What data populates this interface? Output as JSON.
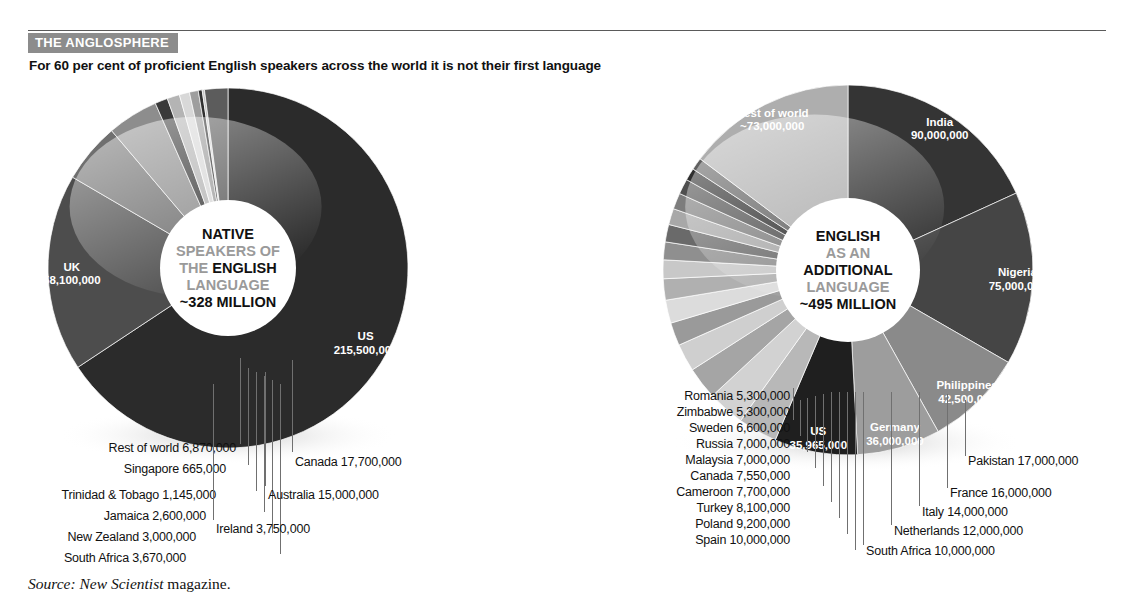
{
  "header": {
    "kicker": "THE ANGLOSPHERE",
    "subhead": "For 60 per cent of proficient English speakers across the world it is not their first language"
  },
  "footer": {
    "source_prefix": "Source:",
    "source_name": "New Scientist",
    "source_suffix": "magazine."
  },
  "chart_data": [
    {
      "type": "pie",
      "id": "native-speakers",
      "title": "NATIVE SPEAKERS OF THE ENGLISH LANGUAGE ~328 MILLION",
      "center_lines": [
        {
          "text": "NATIVE",
          "style": "bold"
        },
        {
          "text": "SPEAKERS OF",
          "style": "grey"
        },
        {
          "text": "THE ENGLISH",
          "style": "mixed"
        },
        {
          "text": "LANGUAGE",
          "style": "grey"
        },
        {
          "text": "~328 MILLION",
          "style": "bold"
        }
      ],
      "total_label": "~328 MILLION",
      "total": 328000000,
      "categories": [
        "US",
        "UK",
        "Canada",
        "Australia",
        "Ireland",
        "South Africa",
        "New Zealand",
        "Jamaica",
        "Trinidad & Tobago",
        "Singapore",
        "Rest of world"
      ],
      "values": [
        215500000,
        58100000,
        17700000,
        15000000,
        3750000,
        3670000,
        3000000,
        2600000,
        1145000,
        665000,
        6870000
      ],
      "value_labels": [
        "215,500,000",
        "58,100,000",
        "17,700,000",
        "15,000,000",
        "3,750,000",
        "3,670,000",
        "3,000,000",
        "2,600,000",
        "1,145,000",
        "665,000",
        "6,870,000"
      ],
      "colors": [
        "#2b2b2b",
        "#4d4d4d",
        "#6f6f6f",
        "#8d8d8d",
        "#3a3a3a",
        "#b4b4b4",
        "#d8d8d8",
        "#9e9e9e",
        "#303030",
        "#c6c6c6",
        "#5c5c5c"
      ],
      "inside_labels": [
        {
          "name": "US",
          "value": "215,500,000"
        },
        {
          "name": "UK",
          "value": "58,100,000"
        }
      ],
      "callouts_left": [
        {
          "name": "Rest of world",
          "value": "6,870,000"
        },
        {
          "name": "Singapore",
          "value": "665,000"
        },
        {
          "name": "Trinidad & Tobago",
          "value": "1,145,000"
        },
        {
          "name": "Jamaica",
          "value": "2,600,000"
        },
        {
          "name": "New Zealand",
          "value": "3,000,000"
        },
        {
          "name": "South Africa",
          "value": "3,670,000"
        }
      ],
      "callouts_right": [
        {
          "name": "Canada",
          "value": "17,700,000"
        },
        {
          "name": "Australia",
          "value": "15,000,000"
        },
        {
          "name": "Ireland",
          "value": "3,750,000"
        }
      ]
    },
    {
      "type": "pie",
      "id": "additional-language",
      "title": "ENGLISH AS AN ADDITIONAL LANGUAGE ~495 MILLION",
      "center_lines": [
        {
          "text": "ENGLISH",
          "style": "bold"
        },
        {
          "text": "AS AN",
          "style": "grey"
        },
        {
          "text": "ADDITIONAL",
          "style": "bold"
        },
        {
          "text": "LANGUAGE",
          "style": "grey"
        },
        {
          "text": "~495 MILLION",
          "style": "bold"
        }
      ],
      "total_label": "~495 MILLION",
      "total": 495000000,
      "categories": [
        "India",
        "Nigeria",
        "Philippines",
        "Germany",
        "US",
        "Pakistan",
        "France",
        "Italy",
        "Netherlands",
        "South Africa",
        "Spain",
        "Poland",
        "Turkey",
        "Cameroon",
        "Canada",
        "Malaysia",
        "Russia",
        "Sweden",
        "Zimbabwe",
        "Romania",
        "Rest of world"
      ],
      "values": [
        90000000,
        75000000,
        42500000,
        36000000,
        35965000,
        17000000,
        16000000,
        14000000,
        12000000,
        10000000,
        10000000,
        9200000,
        8100000,
        7700000,
        7550000,
        7000000,
        7000000,
        6600000,
        5300000,
        5300000,
        73000000
      ],
      "value_labels": [
        "90,000,000",
        "75,000,000",
        "42,500,000",
        "36,000,000",
        "35,965,000",
        "17,000,000",
        "16,000,000",
        "14,000,000",
        "12,000,000",
        "10,000,000",
        "10,000,000",
        "9,200,000",
        "8,100,000",
        "7,700,000",
        "7,550,000",
        "7,000,000",
        "7,000,000",
        "6,600,000",
        "5,300,000",
        "5,300,000",
        "~73,000,000"
      ],
      "colors": [
        "#343434",
        "#454545",
        "#8a8a8a",
        "#9d9d9d",
        "#1f1f1f",
        "#b8b8b8",
        "#d2d2d2",
        "#a5a5a5",
        "#cfcfcf",
        "#9a9a9a",
        "#dcdcdc",
        "#b0b0b0",
        "#c8c8c8",
        "#8f8f8f",
        "#6a6a6a",
        "#a8a8a8",
        "#7d7d7d",
        "#4f4f4f",
        "#2e2e2e",
        "#606060",
        "#aeaeae"
      ],
      "inside_labels": [
        {
          "name": "India",
          "value": "90,000,000"
        },
        {
          "name": "Nigeria",
          "value": "75,000,000"
        },
        {
          "name": "Philippines",
          "value": "42,500,000"
        },
        {
          "name": "Germany",
          "value": "36,000,000"
        },
        {
          "name": "US",
          "value": "35,965,000"
        },
        {
          "name": "Rest of world",
          "value": "~73,000,000"
        }
      ],
      "callouts_left": [
        {
          "name": "Romania",
          "value": "5,300,000"
        },
        {
          "name": "Zimbabwe",
          "value": "5,300,000"
        },
        {
          "name": "Sweden",
          "value": "6,600,000"
        },
        {
          "name": "Russia",
          "value": "7,000,000"
        },
        {
          "name": "Malaysia",
          "value": "7,000,000"
        },
        {
          "name": "Canada",
          "value": "7,550,000"
        },
        {
          "name": "Cameroon",
          "value": "7,700,000"
        },
        {
          "name": "Turkey",
          "value": "8,100,000"
        },
        {
          "name": "Poland",
          "value": "9,200,000"
        },
        {
          "name": "Spain",
          "value": "10,000,000"
        }
      ],
      "callouts_right": [
        {
          "name": "Pakistan",
          "value": "17,000,000"
        },
        {
          "name": "France",
          "value": "16,000,000"
        },
        {
          "name": "Italy",
          "value": "14,000,000"
        },
        {
          "name": "Netherlands",
          "value": "12,000,000"
        },
        {
          "name": "South Africa",
          "value": "10,000,000"
        }
      ]
    }
  ]
}
